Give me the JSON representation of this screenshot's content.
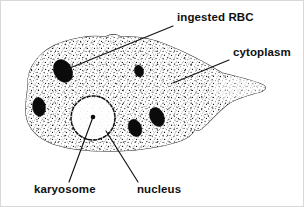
{
  "figure": {
    "width": 304,
    "height": 207,
    "background_color": "#ffffff",
    "outline_color": "#2b2b2b",
    "ink_color": "#0b0b0b",
    "text_color": "#101010"
  },
  "labels": [
    {
      "id": "ingested-rbc",
      "text": "ingested RBC",
      "x": 176,
      "y": 20,
      "anchor": "start",
      "leader": {
        "x1": 172,
        "y1": 25,
        "x2": 64,
        "y2": 69
      }
    },
    {
      "id": "cytoplasm",
      "text": "cytoplasm",
      "x": 232,
      "y": 55,
      "anchor": "start",
      "leader": {
        "x1": 228,
        "y1": 59,
        "x2": 172,
        "y2": 82
      }
    },
    {
      "id": "karyosome",
      "text": "karyosome",
      "x": 33,
      "y": 192,
      "anchor": "start",
      "leader": {
        "x1": 68,
        "y1": 181,
        "x2": 92,
        "y2": 116
      }
    },
    {
      "id": "nucleus",
      "text": "nucleus",
      "x": 136,
      "y": 192,
      "anchor": "start",
      "leader": {
        "x1": 137,
        "y1": 181,
        "x2": 105,
        "y2": 130
      }
    }
  ],
  "structures": {
    "cell_body": {
      "name": "cytoplasm-body",
      "path": "M 27 85 C 25 66, 40 48, 62 41 C 78 36, 92 34, 104 36 C 110 33, 116 33, 120 36 C 136 35, 152 38, 166 44 C 186 52, 205 62, 221 72 C 236 76, 252 79, 262 84 C 266 86, 265 89, 259 91 C 248 94, 236 97, 227 103 C 219 109, 212 117, 205 124 C 200 129, 196 131, 194 128 C 192 133, 186 138, 176 141 C 160 146, 140 149, 118 150 C 94 151, 70 149, 52 143 C 36 137, 27 127, 25 114 C 24 103, 26 93, 27 85 Z"
    },
    "nucleus": {
      "name": "nucleus-ring",
      "cx": 92,
      "cy": 117,
      "r": 22
    },
    "karyosome": {
      "name": "karyosome-dot",
      "cx": 92,
      "cy": 116,
      "r": 2.3
    },
    "ingested_rbcs": [
      {
        "id": "rbc-1",
        "cx": 62,
        "cy": 70,
        "rx": 9,
        "ry": 12,
        "rot": -28
      },
      {
        "id": "rbc-2",
        "cx": 38,
        "cy": 106,
        "rx": 6.5,
        "ry": 9.5,
        "rot": -8
      },
      {
        "id": "rbc-3",
        "cx": 138,
        "cy": 70,
        "rx": 4.5,
        "ry": 6,
        "rot": -18
      },
      {
        "id": "rbc-4",
        "cx": 156,
        "cy": 116,
        "rx": 7,
        "ry": 10,
        "rot": -24
      },
      {
        "id": "rbc-5",
        "cx": 134,
        "cy": 127,
        "rx": 6.5,
        "ry": 9,
        "rot": -22
      }
    ]
  },
  "legend_note": {
    "caption": ""
  }
}
